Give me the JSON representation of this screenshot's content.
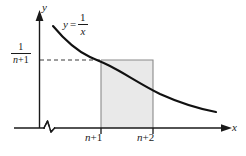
{
  "figure": {
    "axes": {
      "x_name": "x",
      "y_name": "y",
      "x_break_symbol": "zigzag"
    },
    "curve": {
      "equation_lhs": "y",
      "equation_equals": "=",
      "equation_numerator": "1",
      "equation_denominator": "x"
    },
    "x_ticks": [
      {
        "label_prefix": "n",
        "label_suffix": "+1",
        "full": "n+1"
      },
      {
        "label_prefix": "n",
        "label_suffix": "+2",
        "full": "n+2"
      }
    ],
    "y_value_label": {
      "numerator": "1",
      "denominator_var": "n",
      "denominator_rest": "+1",
      "full": "1/(n+1)"
    },
    "shaded_region": {
      "fill_color": "#e9e9e9",
      "x_from": "n+1",
      "x_to": "n+2",
      "height": "1/(n+1)"
    },
    "colors": {
      "ink": "#1a1a1a",
      "curve": "#000000",
      "thin_rule": "#777777",
      "shade": "#e9e9e9",
      "background": "#ffffff"
    }
  }
}
